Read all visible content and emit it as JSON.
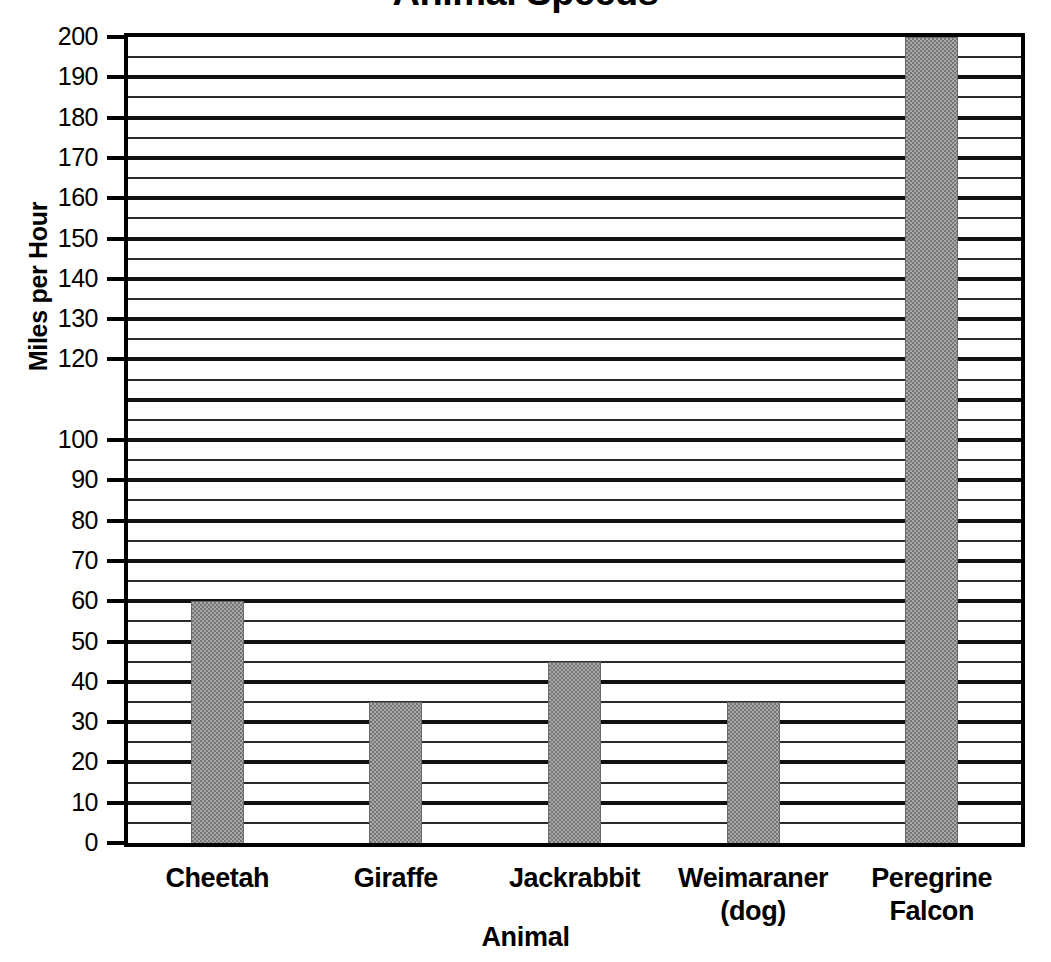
{
  "chart_data": {
    "type": "bar",
    "title": "Animal Speeds",
    "xlabel": "Animal",
    "ylabel": "Miles per Hour",
    "categories": [
      "Cheetah",
      "Giraffe",
      "Jackrabbit",
      "Weimaraner (dog)",
      "Peregrine Falcon"
    ],
    "category_lines": [
      [
        "Cheetah"
      ],
      [
        "Giraffe"
      ],
      [
        "Jackrabbit"
      ],
      [
        "Weimaraner",
        "(dog)"
      ],
      [
        "Peregrine",
        "Falcon"
      ]
    ],
    "values": [
      60,
      35,
      45,
      35,
      200
    ],
    "ylim": [
      0,
      200
    ],
    "major_tick_step": 10,
    "minor_tick_step": 5,
    "grid": true,
    "legend": "none",
    "bar_color": "#a9a9a9",
    "axis_color": "#000000",
    "y_tick_labels": [
      "200",
      "190",
      "180",
      "170",
      "160",
      "150",
      "140",
      "130",
      "120",
      "100",
      "90",
      "80",
      "70",
      "60",
      "50",
      "40",
      "30",
      "20",
      "10",
      "0"
    ],
    "y_tick_values": [
      200,
      190,
      180,
      170,
      160,
      150,
      140,
      130,
      120,
      100,
      90,
      80,
      70,
      60,
      50,
      40,
      30,
      20,
      10,
      0
    ]
  }
}
